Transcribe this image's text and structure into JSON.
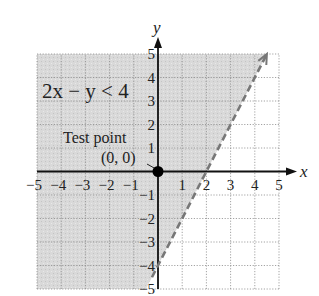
{
  "chart_data": {
    "type": "inequality-region",
    "title": "",
    "xlabel": "x",
    "ylabel": "y",
    "xlim": [
      -5,
      5
    ],
    "ylim": [
      -5,
      5
    ],
    "grid": true,
    "x_ticks": [
      -5,
      -4,
      -3,
      -2,
      -1,
      1,
      2,
      3,
      4,
      5
    ],
    "y_ticks": [
      -5,
      -4,
      -3,
      -2,
      -1,
      1,
      2,
      3,
      4,
      5
    ],
    "x_tick_labels": [
      "−5",
      "−4",
      "−3",
      "−2",
      "−1",
      "1",
      "2",
      "3",
      "4",
      "5"
    ],
    "y_tick_labels": [
      "−5",
      "−4",
      "−3",
      "−2",
      "−1",
      "1",
      "2",
      "3",
      "4",
      "5"
    ],
    "inequality_label": "2x − y < 4",
    "boundary": {
      "equation": "y = 2x − 4",
      "slope": 2,
      "intercept": -4,
      "style": "dashed",
      "from": [
        -0.25,
        -4.5
      ],
      "to": [
        4.5,
        5
      ],
      "arrow_end": "to"
    },
    "shaded_side": "above-left (contains origin)",
    "test_point": {
      "label": "Test point",
      "coord_label": "(0, 0)",
      "x": 0,
      "y": 0
    },
    "colors": {
      "shading": "#d9d9d9",
      "grid": "#8c8c8c",
      "axis": "#111111",
      "boundary": "#777777",
      "point": "#000000"
    }
  }
}
